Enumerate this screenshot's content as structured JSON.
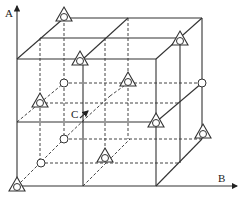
{
  "diagram": {
    "type": "3d-lattice-2x2x2",
    "axes": [
      {
        "label": "A",
        "direction": "vertical"
      },
      {
        "label": "B",
        "direction": "horizontal"
      },
      {
        "label": "C",
        "direction": "depth"
      }
    ],
    "legend_markers": {
      "triangle_with_circle": "site type 1",
      "circle": "site type 2"
    },
    "colors": {
      "stroke": "#333333",
      "background": "#ffffff"
    }
  },
  "labels": {
    "axis_a": "A",
    "axis_b": "B",
    "axis_c": "C"
  }
}
